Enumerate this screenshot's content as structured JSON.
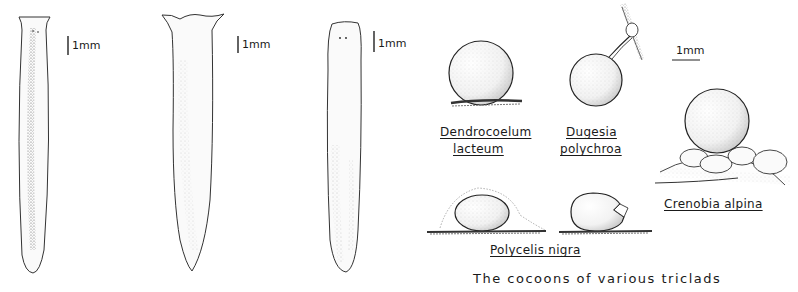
{
  "figure": {
    "caption": "The cocoons of various triclads",
    "worms": [
      {
        "id": "worm-1",
        "scale_label": "1mm"
      },
      {
        "id": "worm-2",
        "scale_label": "1mm"
      },
      {
        "id": "worm-3",
        "scale_label": "1mm"
      }
    ],
    "cocoons": {
      "scale_label": "1mm",
      "species": [
        {
          "name_line1": "Dendrocoelum",
          "name_line2": "lacteum"
        },
        {
          "name_line1": "Dugesia",
          "name_line2": "polychroa"
        },
        {
          "name": "Crenobia alpina"
        },
        {
          "name": "Polycelis nigra"
        }
      ]
    }
  }
}
